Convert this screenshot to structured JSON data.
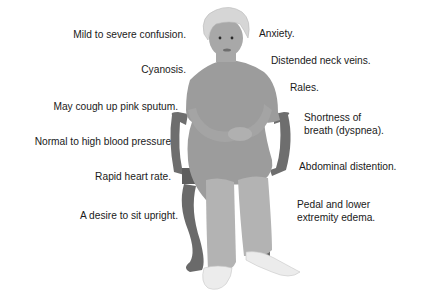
{
  "diagram": {
    "left_labels": [
      "Mild to severe confusion.",
      "Cyanosis.",
      "May cough up pink sputum.",
      "Normal to high blood pressure.",
      "Rapid heart rate.",
      "A desire to sit upright."
    ],
    "right_labels": [
      "Anxiety.",
      "Distended neck veins.",
      "Rales.",
      "Shortness of",
      "breath (dyspnea).",
      "Abdominal distention.",
      "Pedal and lower",
      "extremity edema."
    ],
    "colors": {
      "skin": "#a8a8a8",
      "dress": "#9c9c9c",
      "chair": "#6e6e6e",
      "hair": "#d6d6d6",
      "shoes": "#ececec"
    }
  }
}
